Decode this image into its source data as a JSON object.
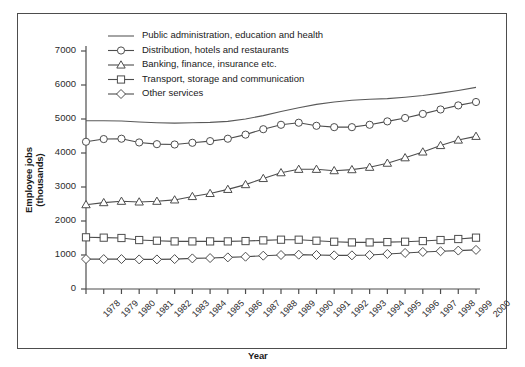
{
  "chart_data": {
    "type": "line",
    "title": "",
    "xlabel": "Year",
    "ylabel": "Employee jobs (thousands)",
    "ylim": [
      0,
      7000
    ],
    "ytick_step": 1000,
    "yticks": [
      0,
      1000,
      2000,
      3000,
      4000,
      5000,
      6000,
      7000
    ],
    "grid": false,
    "legend_position": "top-left-inside",
    "x": [
      1978,
      1979,
      1980,
      1981,
      1982,
      1983,
      1984,
      1985,
      1986,
      1987,
      1988,
      1989,
      1990,
      1991,
      1992,
      1993,
      1994,
      1995,
      1996,
      1997,
      1998,
      1999,
      2000
    ],
    "categories": [
      "1978",
      "1979",
      "1980",
      "1981",
      "1982",
      "1983",
      "1984",
      "1985",
      "1986",
      "1987",
      "1988",
      "1989",
      "1990",
      "1991",
      "1992",
      "1993",
      "1994",
      "1995",
      "1996",
      "1997",
      "1998",
      "1999",
      "2000"
    ],
    "series": [
      {
        "name": "Public administration, education and health",
        "marker": "none",
        "color": "#595959",
        "values": [
          4950,
          4950,
          4940,
          4910,
          4890,
          4880,
          4890,
          4900,
          4930,
          5000,
          5100,
          5220,
          5330,
          5430,
          5500,
          5550,
          5580,
          5600,
          5640,
          5690,
          5760,
          5840,
          5930
        ]
      },
      {
        "name": "Distribution, hotels and restaurants",
        "marker": "circle",
        "color": "#4d4d4d",
        "values": [
          4330,
          4410,
          4420,
          4310,
          4260,
          4250,
          4300,
          4350,
          4420,
          4540,
          4700,
          4830,
          4890,
          4800,
          4760,
          4760,
          4830,
          4930,
          5030,
          5150,
          5280,
          5400,
          5500
        ]
      },
      {
        "name": "Banking, finance, insurance etc.",
        "marker": "triangle",
        "color": "#4d4d4d",
        "values": [
          2480,
          2540,
          2580,
          2560,
          2580,
          2620,
          2720,
          2810,
          2930,
          3070,
          3250,
          3420,
          3520,
          3520,
          3480,
          3510,
          3580,
          3700,
          3860,
          4030,
          4220,
          4380,
          4490
        ]
      },
      {
        "name": "Transport, storage and communication",
        "marker": "square",
        "color": "#4d4d4d",
        "values": [
          1520,
          1510,
          1500,
          1440,
          1420,
          1400,
          1400,
          1400,
          1400,
          1410,
          1430,
          1450,
          1450,
          1420,
          1390,
          1370,
          1370,
          1380,
          1390,
          1410,
          1440,
          1470,
          1510
        ]
      },
      {
        "name": "Other services",
        "marker": "diamond",
        "color": "#4d4d4d",
        "values": [
          880,
          880,
          880,
          870,
          870,
          880,
          900,
          910,
          930,
          950,
          980,
          1000,
          1010,
          1000,
          990,
          990,
          1000,
          1030,
          1060,
          1090,
          1110,
          1130,
          1150
        ]
      }
    ]
  }
}
